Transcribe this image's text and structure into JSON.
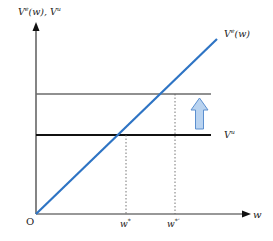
{
  "diagram": {
    "y_axis_label": "V",
    "y_axis_label_sup1": "e",
    "y_axis_label_mid": "(w), V",
    "y_axis_label_sup2": "u",
    "x_axis_label": "w",
    "origin_label": "O",
    "curve_label": "V",
    "curve_label_sup": "e",
    "curve_label_tail": "(w)",
    "hline_label": "V",
    "hline_label_sup": "u",
    "tick_w_star": "w",
    "tick_w_star_sup": "*",
    "tick_w_star_prime": "w",
    "tick_w_star_prime_sup": "*’",
    "colors": {
      "curve": "#2e74c4",
      "hline_lower": "#111111",
      "hline_upper": "#6b6b6b",
      "arrow_fill": "#b9d3f0",
      "arrow_stroke": "#5b8fcf",
      "axis": "#333333"
    }
  }
}
